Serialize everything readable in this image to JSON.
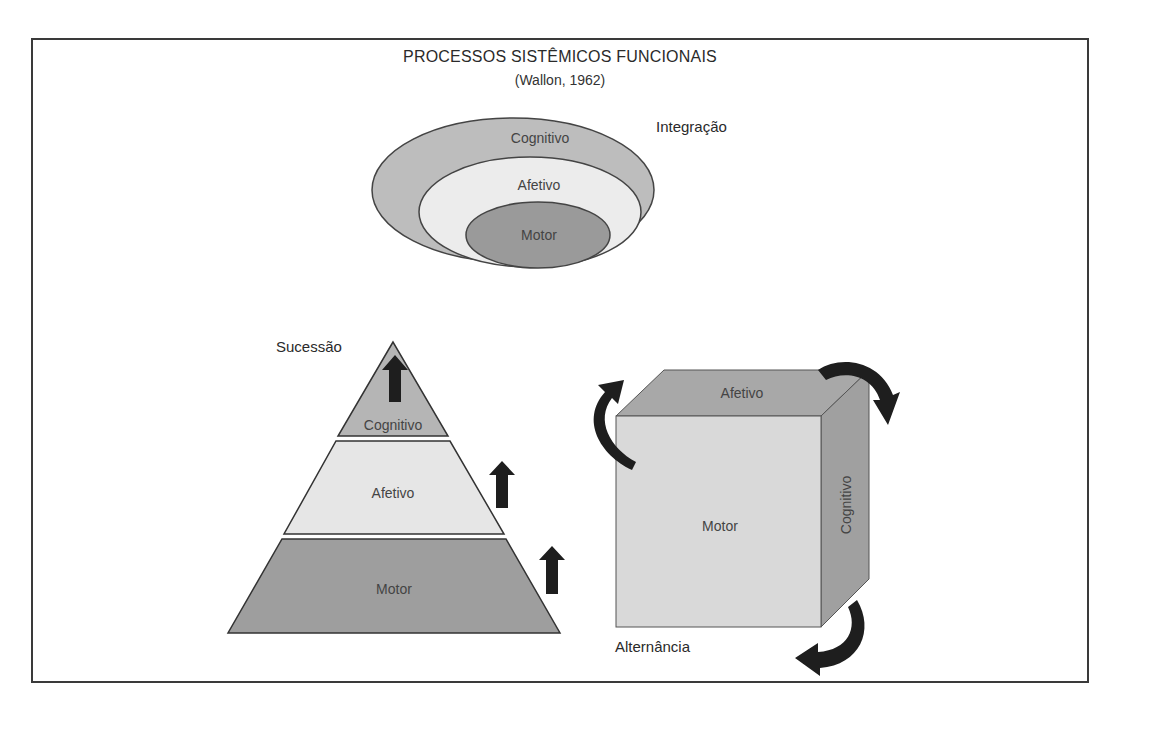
{
  "header": {
    "title": "PROCESSOS SISTÊMICOS FUNCIONAIS",
    "subtitle": "(Wallon, 1962)"
  },
  "integration_diagram": {
    "label": "Integração",
    "layers": [
      {
        "name": "Cognitivo",
        "color": "#bdbdbd"
      },
      {
        "name": "Afetivo",
        "color": "#ececec"
      },
      {
        "name": "Motor",
        "color": "#9a9a9a"
      }
    ]
  },
  "succession_diagram": {
    "label": "Sucessão",
    "levels": [
      {
        "name": "Cognitivo",
        "color": "#b5b5b5"
      },
      {
        "name": "Afetivo",
        "color": "#e6e6e6"
      },
      {
        "name": "Motor",
        "color": "#9e9e9e"
      }
    ]
  },
  "alternation_diagram": {
    "label": "Alternância",
    "faces": {
      "top": {
        "name": "Afetivo",
        "color": "#a8a8a8"
      },
      "front": {
        "name": "Motor",
        "color": "#d9d9d9"
      },
      "side": {
        "name": "Cognitivo",
        "color": "#a0a0a0"
      }
    }
  }
}
